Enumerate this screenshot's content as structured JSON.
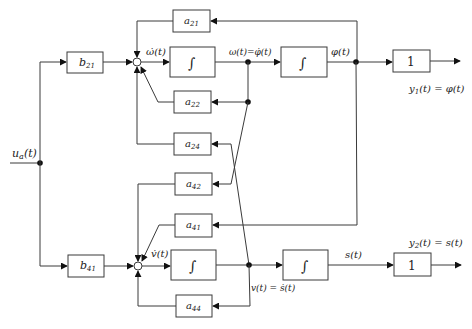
{
  "diagram": {
    "type": "block-diagram",
    "input": {
      "label": "u_a(t)",
      "main": "u",
      "sub": "a",
      "arg": "(t)"
    },
    "blocks": {
      "b21": {
        "main": "b",
        "sub": "21"
      },
      "b41": {
        "main": "b",
        "sub": "41"
      },
      "a21": {
        "main": "a",
        "sub": "21"
      },
      "a22": {
        "main": "a",
        "sub": "22"
      },
      "a24": {
        "main": "a",
        "sub": "24"
      },
      "a42": {
        "main": "a",
        "sub": "42"
      },
      "a41": {
        "main": "a",
        "sub": "41"
      },
      "a44": {
        "main": "a",
        "sub": "44"
      },
      "integrator1": {
        "symbol": "∫"
      },
      "integrator2": {
        "symbol": "∫"
      },
      "integrator3": {
        "symbol": "∫"
      },
      "integrator4": {
        "symbol": "∫"
      },
      "gain_y1": {
        "value": "1"
      },
      "gain_y2": {
        "value": "1"
      }
    },
    "signals": {
      "omega_dot": "ω̇(t)",
      "omega_eq": "ω(t)=φ̇(t)",
      "phi": "φ(t)",
      "v_dot": "v̇(t)",
      "v_eq": "v(t) = ṡ(t)",
      "s": "s(t)"
    },
    "outputs": {
      "y1": {
        "main": "y",
        "sub": "1",
        "rest": "(t) = φ(t)"
      },
      "y2": {
        "main": "y",
        "sub": "2",
        "rest": "(t) = s(t)"
      }
    }
  }
}
